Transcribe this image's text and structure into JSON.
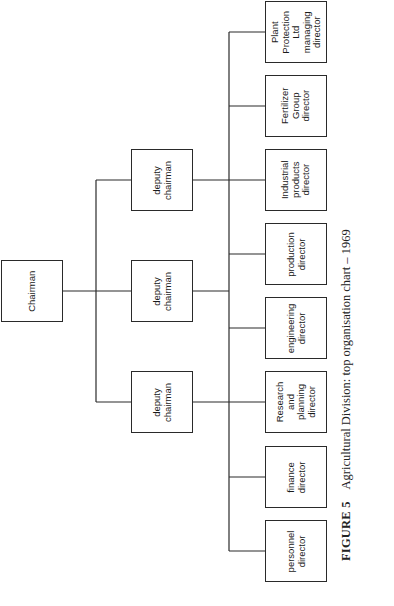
{
  "chart": {
    "type": "org_chart",
    "orientation": "rotated 90 degrees counter-clockwise",
    "root": {
      "label": "Chairman"
    },
    "deputies": [
      {
        "label": "deputy\nchairman"
      },
      {
        "label": "deputy\nchairman"
      },
      {
        "label": "deputy\nchairman"
      }
    ],
    "directors": [
      {
        "label": "Plant\nProtection\nLtd\nmanaging\ndirector"
      },
      {
        "label": "Fertilizer\nGroup\ndirector"
      },
      {
        "label": "Industrial\nproducts\ndirector"
      },
      {
        "label": "production\ndirector"
      },
      {
        "label": "engineering\ndirector"
      },
      {
        "label": "Research\nand\nplanning\ndirector"
      },
      {
        "label": "finance\ndirector"
      },
      {
        "label": "personnel\ndirector"
      }
    ]
  },
  "caption": {
    "figure_number": "FIGURE 5",
    "text": "Agricultural Division: top organisation chart – 1969"
  },
  "colors": {
    "line": "#2a2a2a",
    "background": "#ffffff"
  }
}
